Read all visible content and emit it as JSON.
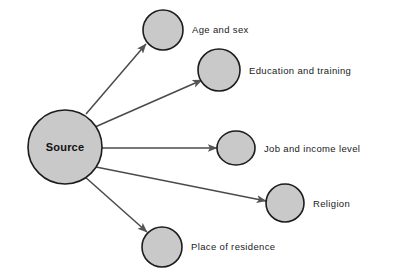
{
  "diagram": {
    "background_color": "#ffffff",
    "node_fill_color": "#c9c9c9",
    "node_stroke_color": "#1c1c1c",
    "edge_color": "#4a4a4a",
    "arrowhead_color": "#555555",
    "text_color": "#1a1a1a",
    "source": {
      "label": "Source",
      "cx": 65,
      "cy": 147,
      "rx": 37,
      "ry": 37
    },
    "nodes": [
      {
        "id": "age-and-sex",
        "label": "Age and sex",
        "cx": 163,
        "cy": 30,
        "rx": 20,
        "ry": 20,
        "label_x": 192,
        "label_y": 30
      },
      {
        "id": "education-and-training",
        "label": "Education and training",
        "cx": 219,
        "cy": 70,
        "rx": 21,
        "ry": 21,
        "label_x": 249,
        "label_y": 71
      },
      {
        "id": "job-and-income-level",
        "label": "Job and income level",
        "cx": 236,
        "cy": 148,
        "rx": 19,
        "ry": 17,
        "label_x": 264,
        "label_y": 149
      },
      {
        "id": "religion",
        "label": "Religion",
        "cx": 285,
        "cy": 203,
        "rx": 19,
        "ry": 19,
        "label_x": 313,
        "label_y": 204
      },
      {
        "id": "place-of-residence",
        "label": "Place of residence",
        "cx": 162,
        "cy": 247,
        "rx": 20,
        "ry": 20,
        "label_x": 191,
        "label_y": 247
      }
    ],
    "edges": [
      {
        "id": "edge-to-age-and-sex",
        "x1": 86,
        "y1": 114,
        "x2": 146,
        "y2": 44
      },
      {
        "id": "edge-to-education-and-training",
        "x1": 95,
        "y1": 127,
        "x2": 202,
        "y2": 80
      },
      {
        "id": "edge-to-job-and-income-level",
        "x1": 102,
        "y1": 148,
        "x2": 217,
        "y2": 148
      },
      {
        "id": "edge-to-religion",
        "x1": 96,
        "y1": 167,
        "x2": 266,
        "y2": 201
      },
      {
        "id": "edge-to-place-of-residence",
        "x1": 84,
        "y1": 176,
        "x2": 147,
        "y2": 232
      }
    ]
  }
}
